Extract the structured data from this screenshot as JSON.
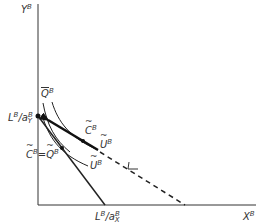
{
  "diagram": {
    "axes": {
      "y_label": "Y",
      "y_label_sup": "B",
      "x_label": "X",
      "x_label_sup": "B"
    },
    "intercepts": {
      "y_intercept": {
        "num": "L",
        "num_sup": "B",
        "sep": "/",
        "den": "a",
        "den_sup": "B",
        "den_sub": "Y"
      },
      "x_intercept": {
        "num": "L",
        "num_sup": "B",
        "sep": "/",
        "den": "a",
        "den_sup": "B",
        "den_sub": "X"
      }
    },
    "curve_labels": {
      "q_bar": {
        "base": "Q",
        "sup": "B",
        "accent": "bar"
      },
      "c_tilde": {
        "base": "C",
        "sup": "B",
        "accent": "tilde"
      },
      "u_tilde_upper": {
        "base": "U",
        "sup": "B",
        "accent": "tilde"
      },
      "u_tilde_lower": {
        "base": "U",
        "sup": "B",
        "accent": "tilde"
      },
      "equilibrium": {
        "left_base": "C",
        "left_sup": "B",
        "eq": "=",
        "right_base": "Q",
        "right_sup": "B",
        "accent": "tilde"
      }
    },
    "colors": {
      "line": "#222222",
      "text": "#333333",
      "background": "#ffffff"
    }
  }
}
